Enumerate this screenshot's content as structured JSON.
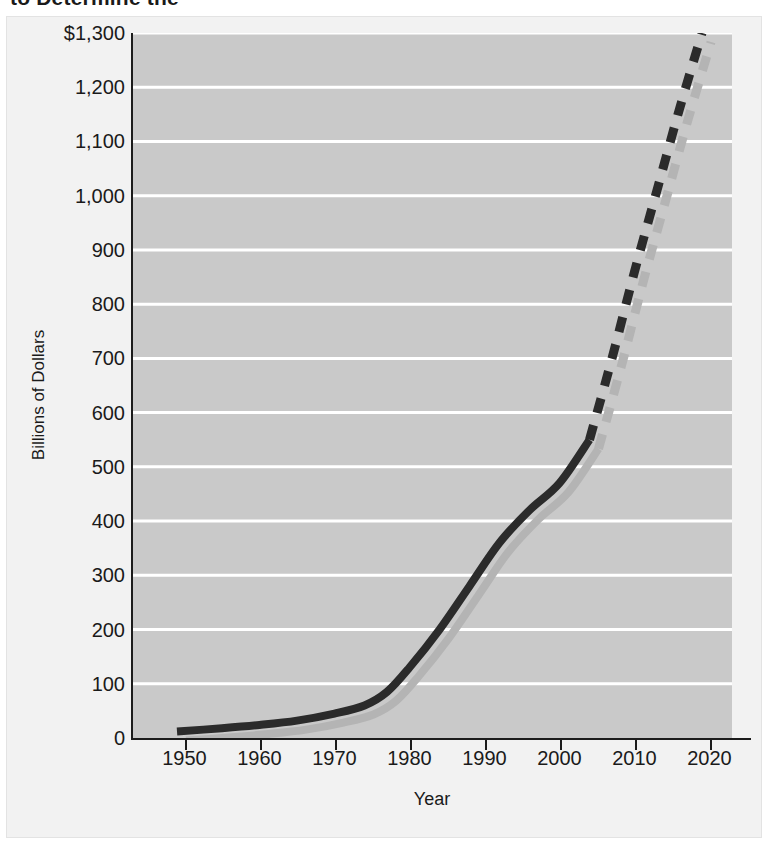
{
  "title": {
    "text": "to Determine the"
  },
  "axis_titles": {
    "y": "Billions of Dollars",
    "x": "Year"
  },
  "chart_data": {
    "type": "line",
    "title": "",
    "xlabel": "Year",
    "ylabel": "Billions of Dollars",
    "xlim": [
      1943,
      2023
    ],
    "ylim": [
      0,
      1300
    ],
    "grid": true,
    "legend_position": "none",
    "x_ticks": [
      1950,
      1960,
      1970,
      1980,
      1990,
      2000,
      2010,
      2020
    ],
    "x_tick_labels": [
      "1950",
      "1960",
      "1970",
      "1980",
      "1990",
      "2000",
      "2010",
      "2020"
    ],
    "y_ticks": [
      0,
      100,
      200,
      300,
      400,
      500,
      600,
      700,
      800,
      900,
      1000,
      1100,
      1200,
      1300
    ],
    "y_tick_labels": [
      "0",
      "100",
      "200",
      "300",
      "400",
      "500",
      "600",
      "700",
      "800",
      "900",
      "1,000",
      "1,100",
      "1,200",
      "$1,300"
    ],
    "series": [
      {
        "name": "Actual",
        "style": "solid",
        "color": "#2b2b2b",
        "x": [
          1949,
          1955,
          1960,
          1965,
          1970,
          1974,
          1977,
          1980,
          1984,
          1988,
          1992,
          1996,
          2000,
          2004
        ],
        "values": [
          12,
          18,
          24,
          32,
          45,
          60,
          85,
          130,
          200,
          280,
          360,
          420,
          470,
          550
        ]
      },
      {
        "name": "Projected",
        "style": "dashed",
        "color": "#2b2b2b",
        "x": [
          2004,
          2007,
          2010,
          2013,
          2016,
          2019
        ],
        "values": [
          550,
          700,
          860,
          1010,
          1160,
          1300
        ]
      }
    ]
  }
}
